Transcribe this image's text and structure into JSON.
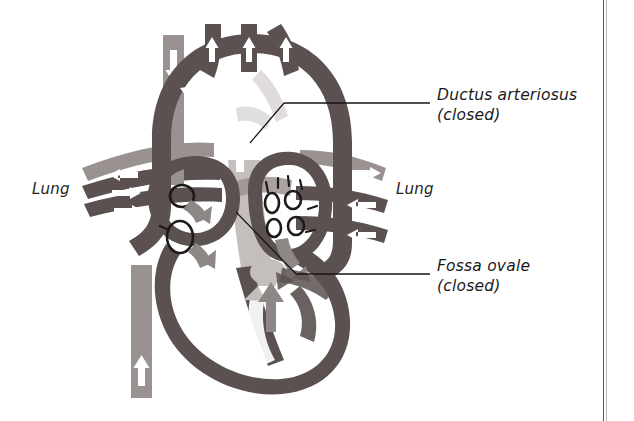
{
  "figure": {
    "background_color": "#ffffff",
    "border_color": "#5c5c5c"
  },
  "palette": {
    "oxygenated_vessel": "#5a5150",
    "deoxygenated_vessel": "#9a9290",
    "closed_structure": "#c4bfbd",
    "flow_arrow_light": "#ffffff",
    "flow_arrow_gray": "#8d8785",
    "outline": "#3a3432",
    "label_text": "#1a1a1a",
    "leader_line": "#141414"
  },
  "annotations": [
    {
      "id": "ductus-arteriosus",
      "name": "Ductus arteriosus",
      "state": "(closed)",
      "leader": {
        "x1": 284,
        "y1": 103,
        "x2": 430,
        "y2": 103
      }
    },
    {
      "id": "fossa-ovale",
      "name": "Fossa ovale",
      "state": "(closed)",
      "leader": {
        "x1": 296,
        "y1": 274,
        "x2": 430,
        "y2": 274
      }
    }
  ],
  "organ_labels": [
    {
      "id": "lung-left",
      "text": "Lung",
      "side": "left"
    },
    {
      "id": "lung-right",
      "text": "Lung",
      "side": "right"
    }
  ],
  "anatomy": {
    "aortic_arch_branches": 3,
    "left_atrium_vein_openings": 4,
    "right_atrium_vein_openings": 2,
    "pulmonary_vessels_right": 3,
    "pulmonary_vessels_left": 3
  }
}
